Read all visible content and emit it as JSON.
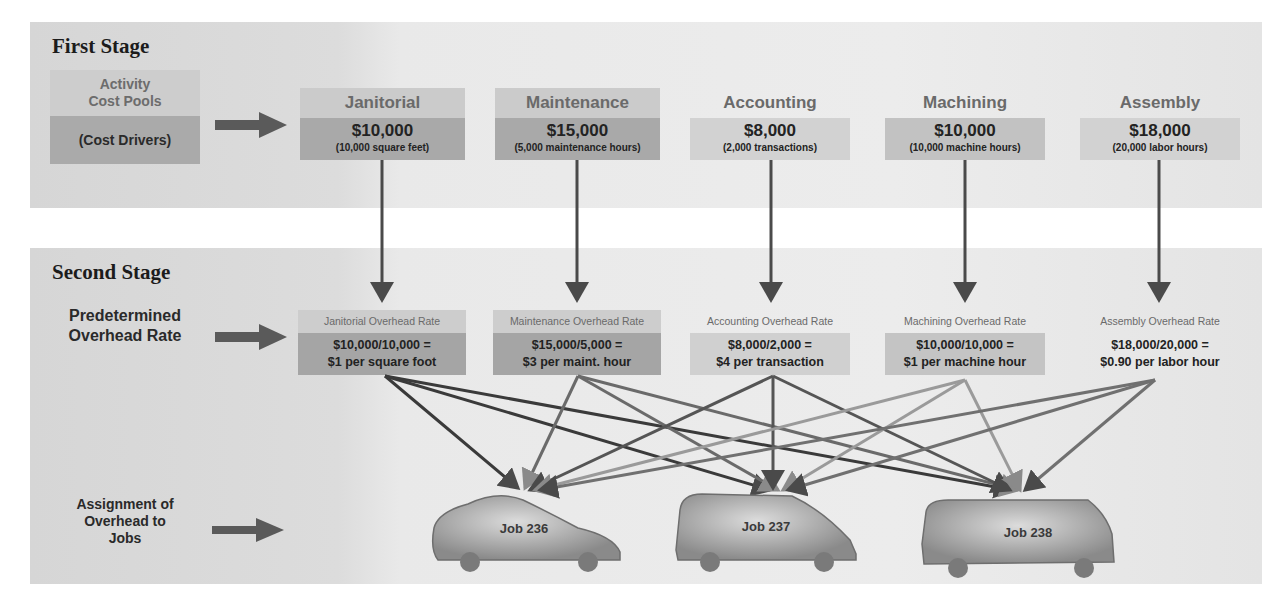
{
  "first_stage": {
    "title": "First Stage",
    "side_box": {
      "line1": "Activity",
      "line2": "Cost Pools",
      "driver_label": "(Cost Drivers)"
    },
    "activities": [
      {
        "name": "Janitorial",
        "amount": "$10,000",
        "driver": "(10,000 square feet)"
      },
      {
        "name": "Maintenance",
        "amount": "$15,000",
        "driver": "(5,000 maintenance hours)"
      },
      {
        "name": "Accounting",
        "amount": "$8,000",
        "driver": "(2,000 transactions)"
      },
      {
        "name": "Machining",
        "amount": "$10,000",
        "driver": "(10,000 machine hours)"
      },
      {
        "name": "Assembly",
        "amount": "$18,000",
        "driver": "(20,000 labor hours)"
      }
    ]
  },
  "second_stage": {
    "title": "Second Stage",
    "rate_label": {
      "line1": "Predetermined",
      "line2": "Overhead Rate"
    },
    "rates": [
      {
        "label": "Janitorial Overhead Rate",
        "formula": "$10,000/10,000 =",
        "result": "$1 per square foot"
      },
      {
        "label": "Maintenance Overhead Rate",
        "formula": "$15,000/5,000 =",
        "result": "$3 per maint. hour"
      },
      {
        "label": "Accounting Overhead Rate",
        "formula": "$8,000/2,000 =",
        "result": "$4 per transaction"
      },
      {
        "label": "Machining Overhead Rate",
        "formula": "$10,000/10,000 =",
        "result": "$1 per machine hour"
      },
      {
        "label": "Assembly Overhead Rate",
        "formula": "$18,000/20,000 =",
        "result": "$0.90 per labor hour"
      }
    ],
    "assignment_label": {
      "line1": "Assignment of",
      "line2": "Overhead to",
      "line3": "Jobs"
    },
    "jobs": [
      {
        "label": "Job 236"
      },
      {
        "label": "Job 237"
      },
      {
        "label": "Job 238"
      }
    ]
  },
  "colors": {
    "panel_bg": "#e4e4e4",
    "box_header": "#cbcbcb",
    "box_value": "#a9a9a9",
    "arrow": "#555555",
    "text_dark": "#222222",
    "text_muted": "#6a6a6a"
  }
}
